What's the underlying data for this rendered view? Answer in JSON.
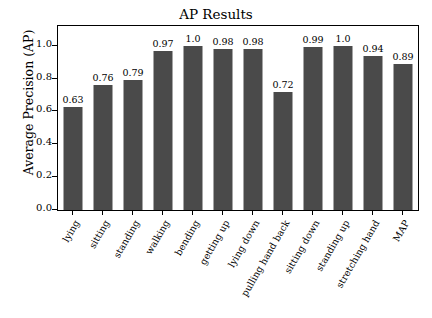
{
  "chart_data": {
    "type": "bar",
    "title": "AP Results",
    "xlabel": "",
    "ylabel": "Average Precision (AP)",
    "categories": [
      "lying",
      "sitting",
      "standing",
      "walking",
      "bending",
      "getting up",
      "lying down",
      "pulling hand back",
      "sitting down",
      "standing up",
      "stretching hand",
      "MAP"
    ],
    "values": [
      0.63,
      0.76,
      0.79,
      0.97,
      1.0,
      0.98,
      0.98,
      0.72,
      0.99,
      1.0,
      0.94,
      0.89
    ],
    "value_labels": [
      "0.63",
      "0.76",
      "0.79",
      "0.97",
      "1.0",
      "0.98",
      "0.98",
      "0.72",
      "0.99",
      "1.0",
      "0.94",
      "0.89"
    ],
    "ylim": [
      0.0,
      1.12
    ],
    "yticks": [
      0.0,
      0.2,
      0.4,
      0.6,
      0.8,
      1.0
    ],
    "ytick_labels": [
      "0.0",
      "0.2",
      "0.4",
      "0.6",
      "0.8",
      "1.0"
    ],
    "grid": false,
    "legend": null,
    "bar_color": "#4a4a4a",
    "axis_color": "#000000",
    "background": "#ffffff"
  }
}
